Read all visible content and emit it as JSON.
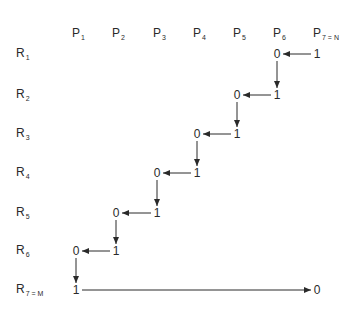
{
  "columns": [
    {
      "base": "P",
      "sub": "1",
      "x": 72
    },
    {
      "base": "P",
      "sub": "2",
      "x": 112
    },
    {
      "base": "P",
      "sub": "3",
      "x": 153
    },
    {
      "base": "P",
      "sub": "4",
      "x": 193
    },
    {
      "base": "P",
      "sub": "5",
      "x": 233
    },
    {
      "base": "P",
      "sub": "6",
      "x": 273
    },
    {
      "base": "P",
      "sub": "7 = N",
      "x": 313
    }
  ],
  "rows": [
    {
      "base": "R",
      "sub": "1",
      "y": 53
    },
    {
      "base": "R",
      "sub": "2",
      "y": 94
    },
    {
      "base": "R",
      "sub": "3",
      "y": 133
    },
    {
      "base": "R",
      "sub": "4",
      "y": 172
    },
    {
      "base": "R",
      "sub": "5",
      "y": 212
    },
    {
      "base": "R",
      "sub": "6",
      "y": 250
    },
    {
      "base": "R",
      "sub": "7 = M",
      "y": 289
    }
  ],
  "cells": [
    {
      "row": 1,
      "col": 6,
      "value": "0"
    },
    {
      "row": 1,
      "col": 7,
      "value": "1"
    },
    {
      "row": 2,
      "col": 5,
      "value": "0"
    },
    {
      "row": 2,
      "col": 6,
      "value": "1"
    },
    {
      "row": 3,
      "col": 4,
      "value": "0"
    },
    {
      "row": 3,
      "col": 5,
      "value": "1"
    },
    {
      "row": 4,
      "col": 3,
      "value": "0"
    },
    {
      "row": 4,
      "col": 4,
      "value": "1"
    },
    {
      "row": 5,
      "col": 2,
      "value": "0"
    },
    {
      "row": 5,
      "col": 3,
      "value": "1"
    },
    {
      "row": 6,
      "col": 1,
      "value": "0"
    },
    {
      "row": 6,
      "col": 2,
      "value": "1"
    },
    {
      "row": 7,
      "col": 1,
      "value": "1"
    },
    {
      "row": 7,
      "col": 7,
      "value": "0"
    }
  ],
  "arrows": [
    {
      "type": "left",
      "from": [
        1,
        7
      ],
      "to": [
        1,
        6
      ]
    },
    {
      "type": "down",
      "from": [
        1,
        6
      ],
      "to": [
        2,
        6
      ]
    },
    {
      "type": "left",
      "from": [
        2,
        6
      ],
      "to": [
        2,
        5
      ]
    },
    {
      "type": "down",
      "from": [
        2,
        5
      ],
      "to": [
        3,
        5
      ]
    },
    {
      "type": "left",
      "from": [
        3,
        5
      ],
      "to": [
        3,
        4
      ]
    },
    {
      "type": "down",
      "from": [
        3,
        4
      ],
      "to": [
        4,
        4
      ]
    },
    {
      "type": "left",
      "from": [
        4,
        4
      ],
      "to": [
        4,
        3
      ]
    },
    {
      "type": "down",
      "from": [
        4,
        3
      ],
      "to": [
        5,
        3
      ]
    },
    {
      "type": "left",
      "from": [
        5,
        3
      ],
      "to": [
        5,
        2
      ]
    },
    {
      "type": "down",
      "from": [
        5,
        2
      ],
      "to": [
        6,
        2
      ]
    },
    {
      "type": "left",
      "from": [
        6,
        2
      ],
      "to": [
        6,
        1
      ]
    },
    {
      "type": "down",
      "from": [
        6,
        1
      ],
      "to": [
        7,
        1
      ]
    },
    {
      "type": "right",
      "from": [
        7,
        1
      ],
      "to": [
        7,
        7
      ]
    }
  ],
  "layout": {
    "header_y": 27,
    "row_label_x": 16,
    "line_color": "#2a2a2a"
  }
}
